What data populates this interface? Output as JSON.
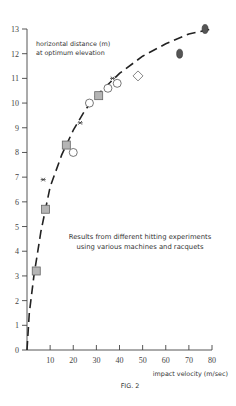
{
  "chart_data": {
    "type": "scatter",
    "title": "",
    "ylabel": "horizontal distance (m) at optimum elevation",
    "ylabel_lines": [
      "horizontal distance (m)",
      "at optimum elevation"
    ],
    "xlabel": "impact velocity (m/sec)",
    "caption": "FIG. 2",
    "annotation_lines": [
      "Results from different hitting experiments",
      "using various machines and racquets"
    ],
    "xlim": [
      0,
      80
    ],
    "ylim": [
      0,
      13
    ],
    "x_ticks": [
      10,
      20,
      30,
      40,
      50,
      60,
      70,
      80
    ],
    "y_ticks": [
      0,
      1,
      2,
      3,
      4,
      5,
      6,
      7,
      8,
      9,
      10,
      11,
      12,
      13
    ],
    "grid": false,
    "series": [
      {
        "name": "grey squares",
        "marker": "square-filled-grey",
        "points": [
          [
            4,
            3.2
          ],
          [
            8,
            5.7
          ],
          [
            17,
            8.3
          ],
          [
            31,
            10.3
          ]
        ]
      },
      {
        "name": "open circles",
        "marker": "circle-open",
        "points": [
          [
            20,
            8.0
          ],
          [
            27,
            10.0
          ],
          [
            35,
            10.6
          ],
          [
            39,
            10.8
          ]
        ]
      },
      {
        "name": "asterisks",
        "marker": "asterisk",
        "points": [
          [
            7,
            6.9
          ],
          [
            23,
            9.2
          ],
          [
            37,
            11.0
          ]
        ]
      },
      {
        "name": "open diamond",
        "marker": "diamond-open",
        "points": [
          [
            48,
            11.1
          ]
        ]
      },
      {
        "name": "dark ovals",
        "marker": "ellipse-filled-dark",
        "points": [
          [
            66,
            12.0
          ],
          [
            77,
            13.0
          ]
        ]
      },
      {
        "name": "fitted curve",
        "style": "dashed",
        "points": [
          [
            0,
            0
          ],
          [
            1,
            1.5
          ],
          [
            3,
            3.0
          ],
          [
            6,
            4.8
          ],
          [
            10,
            6.6
          ],
          [
            15,
            7.9
          ],
          [
            20,
            8.9
          ],
          [
            25,
            9.7
          ],
          [
            30,
            10.3
          ],
          [
            40,
            11.2
          ],
          [
            50,
            11.9
          ],
          [
            60,
            12.4
          ],
          [
            70,
            12.8
          ],
          [
            80,
            13.0
          ]
        ]
      }
    ]
  }
}
